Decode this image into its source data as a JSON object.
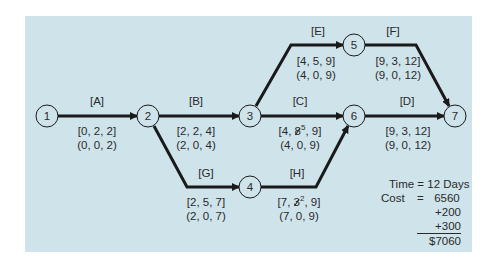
{
  "diagram": {
    "colors": {
      "panel": "#cfe3ea",
      "arrow": "#1a1a1a",
      "text": "#2a2a2a"
    },
    "nodes": [
      {
        "id": "1",
        "label": "1"
      },
      {
        "id": "2",
        "label": "2"
      },
      {
        "id": "3",
        "label": "3"
      },
      {
        "id": "4",
        "label": "4"
      },
      {
        "id": "5",
        "label": "5"
      },
      {
        "id": "6",
        "label": "6"
      },
      {
        "id": "7",
        "label": "7"
      }
    ],
    "activities": [
      {
        "name": "[A]",
        "from": "1",
        "to": "2",
        "top_triplet": "[0, 2, 2]",
        "bottom_triplet": "(0, 0, 2)"
      },
      {
        "name": "[B]",
        "from": "2",
        "to": "3",
        "top_triplet": "[2, 2, 4]",
        "bottom_triplet": "(2, 0, 4)"
      },
      {
        "name": "[C]",
        "from": "3",
        "to": "6",
        "top_prefix": "[4, ",
        "struck": "8",
        "replacement": "5",
        "top_suffix": ", 9]",
        "bottom_triplet": "(4, 0, 9)"
      },
      {
        "name": "[D]",
        "from": "6",
        "to": "7",
        "top_triplet": "[9, 3, 12]",
        "bottom_triplet": "(9, 0, 12)"
      },
      {
        "name": "[E]",
        "from": "3",
        "to": "5",
        "top_triplet": "[4, 5, 9]",
        "bottom_triplet": "(4, 0, 9)"
      },
      {
        "name": "[F]",
        "from": "5",
        "to": "7",
        "top_triplet": "[9, 3, 12]",
        "bottom_triplet": "(9, 0, 12)"
      },
      {
        "name": "[G]",
        "from": "2",
        "to": "4",
        "top_triplet": "[2, 5, 7]",
        "bottom_triplet": "(2, 0, 7)"
      },
      {
        "name": "[H]",
        "from": "4",
        "to": "6",
        "top_prefix": "[7, ",
        "struck": "3",
        "replacement": "2",
        "top_suffix": ", 9]",
        "bottom_triplet": "(7, 0, 9)"
      }
    ],
    "summary": {
      "time_line": "Time = 12 Days",
      "cost_label": "Cost",
      "cost_eq": "=",
      "cost_base": "6560",
      "add1": "+200",
      "add2": "+300",
      "total": "$7060"
    }
  }
}
